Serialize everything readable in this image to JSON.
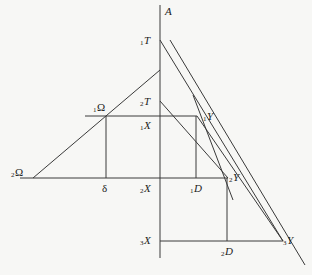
{
  "diagram": {
    "axis_label": "A",
    "labels": {
      "T1": {
        "sub": "1",
        "main": "T"
      },
      "T2": {
        "sub": "2",
        "main": "T"
      },
      "X1": {
        "sub": "1",
        "main": "X"
      },
      "X2": {
        "sub": "2",
        "main": "X"
      },
      "X3": {
        "sub": "3",
        "main": "X"
      },
      "Y1": {
        "sub": "1",
        "main": "Y"
      },
      "Y2": {
        "sub": "2",
        "main": "Y"
      },
      "Y3": {
        "sub": "3",
        "main": "Y"
      },
      "D1": {
        "sub": "1",
        "main": "D"
      },
      "D2": {
        "sub": "2",
        "main": "D"
      },
      "Omega1": {
        "sub": "1",
        "main": "Ω"
      },
      "Omega2": {
        "sub": "2",
        "main": "Ω"
      },
      "delta": {
        "main": "δ"
      }
    },
    "colors": {
      "line": "#3a3a3a",
      "background": "#f7f7f5",
      "text": "#222222"
    }
  }
}
